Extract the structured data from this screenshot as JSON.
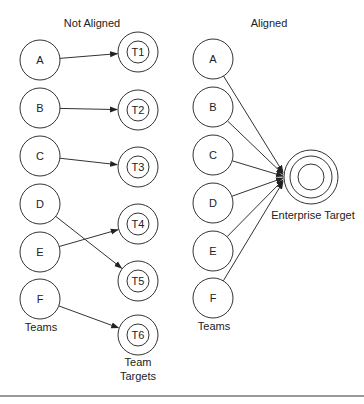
{
  "left_panel": {
    "title": "Not Aligned",
    "teams_label": "Teams",
    "targets_label_line1": "Team",
    "targets_label_line2": "Targets",
    "teams": [
      {
        "id": "A",
        "label": "A",
        "cx": 40,
        "cy": 60
      },
      {
        "id": "B",
        "label": "B",
        "cx": 40,
        "cy": 108
      },
      {
        "id": "C",
        "label": "C",
        "cx": 40,
        "cy": 156
      },
      {
        "id": "D",
        "label": "D",
        "cx": 40,
        "cy": 204
      },
      {
        "id": "E",
        "label": "E",
        "cx": 40,
        "cy": 252
      },
      {
        "id": "F",
        "label": "F",
        "cx": 40,
        "cy": 299
      }
    ],
    "targets": [
      {
        "id": "T1",
        "label": "T1",
        "cx": 138,
        "cy": 52
      },
      {
        "id": "T2",
        "label": "T2",
        "cx": 138,
        "cy": 110
      },
      {
        "id": "T3",
        "label": "T3",
        "cx": 138,
        "cy": 167
      },
      {
        "id": "T4",
        "label": "T4",
        "cx": 138,
        "cy": 224
      },
      {
        "id": "T5",
        "label": "T5",
        "cx": 138,
        "cy": 281
      },
      {
        "id": "T6",
        "label": "T6",
        "cx": 138,
        "cy": 335
      }
    ],
    "edges": [
      {
        "from": "A",
        "to": "T1"
      },
      {
        "from": "B",
        "to": "T2"
      },
      {
        "from": "C",
        "to": "T3"
      },
      {
        "from": "D",
        "to": "T5"
      },
      {
        "from": "E",
        "to": "T4"
      },
      {
        "from": "F",
        "to": "T6"
      }
    ]
  },
  "right_panel": {
    "title": "Aligned",
    "teams_label": "Teams",
    "target_label": "Enterprise Target",
    "teams": [
      {
        "id": "A",
        "label": "A",
        "cx": 213,
        "cy": 59
      },
      {
        "id": "B",
        "label": "B",
        "cx": 213,
        "cy": 107
      },
      {
        "id": "C",
        "label": "C",
        "cx": 213,
        "cy": 155
      },
      {
        "id": "D",
        "label": "D",
        "cx": 213,
        "cy": 203
      },
      {
        "id": "E",
        "label": "E",
        "cx": 213,
        "cy": 251
      },
      {
        "id": "F",
        "label": "F",
        "cx": 213,
        "cy": 298
      }
    ],
    "target": {
      "cx": 311,
      "cy": 177,
      "radii": [
        27,
        21,
        13
      ]
    },
    "edges_to": "enterprise-target"
  },
  "colors": {
    "stroke": "#333333",
    "text": "#222222",
    "background": "#ffffff",
    "rule": "#777777"
  }
}
